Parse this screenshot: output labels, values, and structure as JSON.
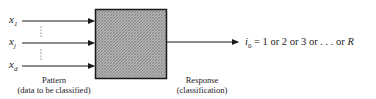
{
  "diagram": {
    "type": "block-diagram",
    "inputs": [
      {
        "symbol": "x",
        "subscript": "1"
      },
      {
        "symbol": "x",
        "subscript": "j"
      },
      {
        "symbol": "x",
        "subscript": "d"
      }
    ],
    "ellipsis": "⋮",
    "block": {
      "fill": "#a8a8a8",
      "border": "#1a1a1a",
      "pattern": "cross-hatch"
    },
    "input_caption": {
      "line1": "Pattern",
      "line2": "(data to be classified)"
    },
    "output_caption": {
      "line1": "Response",
      "line2": "(classification)"
    },
    "output": {
      "symbol": "i",
      "subscript": "0",
      "expression": "= 1 or 2 or 3 or . . . or",
      "last": "R"
    }
  }
}
